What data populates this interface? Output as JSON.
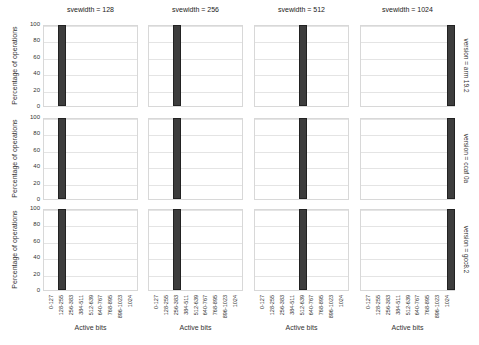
{
  "chart_data": {
    "type": "bar",
    "layout": "facet-grid 3 rows x 4 columns",
    "col_facet": "svewidth",
    "row_facet": "version",
    "col_titles": [
      "svewidth = 128",
      "svewidth = 256",
      "svewidth = 512",
      "svewidth = 1024"
    ],
    "row_titles": [
      "version = arm 19.2",
      "version = ccaf 0a",
      "version = gcc8.2"
    ],
    "categories": [
      "0-127",
      "128-255",
      "256-383",
      "384-511",
      "512-639",
      "640-767",
      "768-895",
      "896-1023",
      "1024"
    ],
    "xlabel": "Active bits",
    "ylabel": "Percentage of operations",
    "ylim": [
      0,
      100
    ],
    "yticks": [
      "0",
      "20",
      "40",
      "60",
      "80",
      "100"
    ],
    "grid": true,
    "bar_color": "#3d3d3d",
    "panels": [
      {
        "row": 0,
        "col": 0,
        "values": [
          0,
          100,
          0,
          0,
          0,
          0,
          0,
          0,
          0
        ]
      },
      {
        "row": 0,
        "col": 1,
        "values": [
          0,
          0,
          100,
          0,
          0,
          0,
          0,
          0,
          0
        ]
      },
      {
        "row": 0,
        "col": 2,
        "values": [
          0,
          0,
          0,
          0,
          100,
          0,
          0,
          0,
          0
        ]
      },
      {
        "row": 0,
        "col": 3,
        "values": [
          0,
          0,
          0,
          0,
          0,
          0,
          0,
          0,
          100
        ]
      },
      {
        "row": 1,
        "col": 0,
        "values": [
          0,
          100,
          0,
          0,
          0,
          0,
          0,
          0,
          0
        ]
      },
      {
        "row": 1,
        "col": 1,
        "values": [
          0,
          0,
          100,
          0,
          0,
          0,
          0,
          0,
          0
        ]
      },
      {
        "row": 1,
        "col": 2,
        "values": [
          0,
          0,
          0,
          0,
          100,
          0,
          0,
          0,
          0
        ]
      },
      {
        "row": 1,
        "col": 3,
        "values": [
          0,
          0,
          0,
          0,
          0,
          0,
          0,
          0,
          100
        ]
      },
      {
        "row": 2,
        "col": 0,
        "values": [
          0,
          100,
          0,
          0,
          0,
          0,
          0,
          0,
          0
        ]
      },
      {
        "row": 2,
        "col": 1,
        "values": [
          0,
          0,
          100,
          0,
          0,
          0,
          0,
          0,
          0
        ]
      },
      {
        "row": 2,
        "col": 2,
        "values": [
          0,
          0,
          0,
          0,
          100,
          0,
          0,
          0,
          0
        ]
      },
      {
        "row": 2,
        "col": 3,
        "values": [
          0,
          0,
          0,
          0,
          0,
          0,
          0,
          0,
          100
        ]
      }
    ]
  }
}
